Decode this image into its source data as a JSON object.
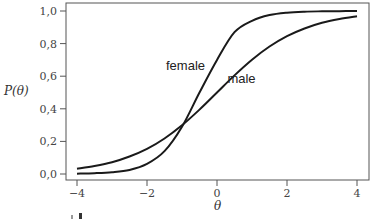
{
  "chart_data": {
    "type": "line",
    "title": "",
    "xlabel": "θ",
    "ylabel": "P(θ)",
    "xlim": [
      -4,
      4
    ],
    "ylim": [
      0,
      1
    ],
    "xticks": [
      -4,
      -2,
      0,
      2,
      4
    ],
    "xtick_labels": [
      "−4",
      "−2",
      "0",
      "2",
      "4"
    ],
    "yticks": [
      0,
      0.2,
      0.4,
      0.6,
      0.8,
      1.0
    ],
    "ytick_labels": [
      "0,0",
      "0,2",
      "0,4",
      "0,6",
      "0,8",
      "1,0"
    ],
    "grid": false,
    "legend": "inline labels",
    "x": [
      -4,
      -3.5,
      -3,
      -2.5,
      -2,
      -1.5,
      -1,
      -0.5,
      0,
      0.5,
      1,
      1.5,
      2,
      2.5,
      3,
      3.5,
      4
    ],
    "series": [
      {
        "name": "female",
        "values": [
          0.002,
          0.005,
          0.011,
          0.025,
          0.062,
          0.14,
          0.29,
          0.5,
          0.7,
          0.87,
          0.94,
          0.975,
          0.99,
          0.996,
          0.998,
          0.999,
          1.0
        ],
        "label_pos": {
          "x": -0.9,
          "y": 0.64
        }
      },
      {
        "name": "male",
        "values": [
          0.032,
          0.049,
          0.072,
          0.107,
          0.154,
          0.218,
          0.299,
          0.395,
          0.5,
          0.605,
          0.701,
          0.782,
          0.846,
          0.893,
          0.928,
          0.951,
          0.968
        ],
        "label_pos": {
          "x": 0.7,
          "y": 0.56
        }
      }
    ],
    "crossing_point": {
      "x": -0.83,
      "y": 0.33
    }
  },
  "labels": {
    "ylabel": "P(θ)",
    "xlabel": "θ",
    "female": "female",
    "male": "male"
  }
}
